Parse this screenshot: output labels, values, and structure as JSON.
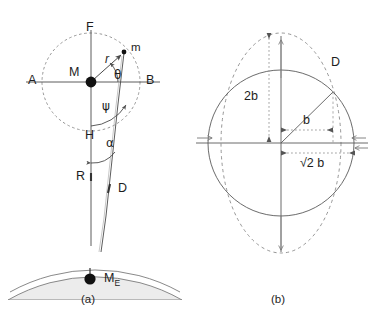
{
  "figure": {
    "panels": [
      {
        "id": "a",
        "caption": "(a)"
      },
      {
        "id": "b",
        "caption": "(b)"
      }
    ],
    "colors": {
      "stroke": "#4a4a4a",
      "dashed": "#7a7a7a",
      "dotted": "#8a8a8a",
      "fill_earth": "#ebebeb",
      "dot": "#111111",
      "text": "#1d1d1d",
      "background": "#ffffff"
    }
  },
  "panel_a": {
    "caption": "(a)",
    "labels": {
      "axis_left": "A",
      "axis_right": "B",
      "axis_top": "F",
      "axis_bottom": "H",
      "center_mass": "M",
      "tip_mass": "m",
      "radius": "r",
      "angle_theta": "θ",
      "angle_psi": "ψ",
      "angle_alpha": "α",
      "tether_R": "R",
      "tether_D": "D",
      "earth_mass": "M",
      "earth_mass_sub": "E"
    },
    "geometry": {
      "center_x": 91,
      "center_y": 82,
      "circle_radius": 49,
      "tip_x": 124,
      "tip_y": 52,
      "axis_left_x": 26,
      "axis_right_x": 160,
      "axis_top_y": 30,
      "axis_bottom_y": 246,
      "earth_center_x": 120,
      "earth_center_y": 420,
      "earth_radius": 175
    }
  },
  "panel_b": {
    "caption": "(b)",
    "labels": {
      "point_D": "D",
      "vertical_extent": "2b",
      "horizontal_b": "b",
      "horizontal_sqrt2b": "√2 b"
    },
    "geometry": {
      "center_x": 281,
      "center_y": 143,
      "circle_radius": 73,
      "ellipse_rx": 60,
      "ellipse_ry": 110,
      "point_D_x": 333,
      "point_D_y": 92
    }
  }
}
